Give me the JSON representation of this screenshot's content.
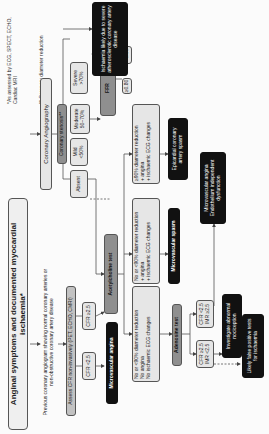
{
  "title": "Anginal symptoms and documented myocardial ischaemia*",
  "footnotes": {
    "assessed": "*As assessed by ECG, SPECT, ECHO, Cardiac MRI",
    "diameter": "** Coronary diameter reduction"
  },
  "nodes": {
    "previous_angiogram": "Previous coronary angiogram showing normal coronary arteries or non-obstructive coronary artery disease",
    "assess_cfr": "Assess CFR non-invasively (PET, ECHO, CMRI)",
    "cfr_lt": "CFR <2.5",
    "cfr_ge": "CFR ≥2.5",
    "microvascular_angina": "Microvascular angina",
    "coronary_angiography": "Coronary Angiography",
    "coronary_stenosis": "Coronary stenosis**",
    "absent": "Absent",
    "mild": "Mild <50%",
    "moderate": "Moderate 50–70%",
    "severe": "Severe >70%",
    "ffr": "FFR",
    "ffr_high": "≥0.80",
    "ffr_low": "<0.80",
    "ischaemia_atherosclerotic": "Ischaemia likely due to severe atherosclerotic coronary artery disease",
    "acetylcholine_test": "Acetylcholine test",
    "ach_result_epicardial": [
      "≥90% diameter reduction",
      "+ angina",
      "+ ischaemic ECG changes"
    ],
    "epicardial_spasm": "Epicardial coronary artery spasm",
    "ach_result_micro": [
      "No or <90% diameter reduction",
      "+ angina",
      "+ ischaemic ECG changes"
    ],
    "microvascular_spasm": "Microvascular spasm",
    "ach_result_negative": [
      "No or <90% diameter reduction",
      "No angina",
      "No ischaemic ECG changes"
    ],
    "adenosine_test": "Adenosine test",
    "adeno_normal": "CFR ≥2.5 IMR <2.5",
    "adeno_abnormal": "CFR <2.5 IMR ≥2.5",
    "microvascular_angina_endo": "Microvascular angina Endothelium independent dysfunction",
    "investigate_nociception": "Investigate abnormal nociception",
    "false_positive": "Likely false positive tests for ischaemia"
  }
}
